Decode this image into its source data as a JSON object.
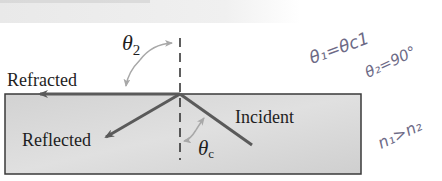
{
  "diagram": {
    "type": "total-internal-reflection",
    "labels": {
      "refracted": "Refracted",
      "reflected": "Reflected",
      "incident": "Incident",
      "theta2": "θ",
      "theta2_sub": "2",
      "thetac": "θ",
      "thetac_sub": "c"
    },
    "annotations": {
      "line1": "θ₁=θc1",
      "line2": "θ₂=90°",
      "line3": "n₁>n₂"
    },
    "colors": {
      "medium_fill": "#d6d6d6",
      "ray": "#5a5a5a",
      "arc": "#a8a8a8",
      "border": "#3a3a3a",
      "handwriting": "#6d6a86",
      "top_band": "#ececec"
    }
  }
}
